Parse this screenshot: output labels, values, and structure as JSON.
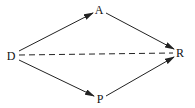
{
  "diagram": {
    "nodes": [
      {
        "id": "D",
        "label": "D",
        "x": 11,
        "y": 56
      },
      {
        "id": "A",
        "label": "A",
        "x": 99,
        "y": 10
      },
      {
        "id": "R",
        "label": "R",
        "x": 180,
        "y": 53
      },
      {
        "id": "P",
        "label": "P",
        "x": 100,
        "y": 99
      }
    ],
    "edges": [
      {
        "from": "D",
        "to": "A",
        "style": "solid",
        "arrow": true
      },
      {
        "from": "A",
        "to": "R",
        "style": "solid",
        "arrow": true
      },
      {
        "from": "D",
        "to": "P",
        "style": "solid",
        "arrow": true
      },
      {
        "from": "P",
        "to": "R",
        "style": "solid",
        "arrow": true
      },
      {
        "from": "D",
        "to": "R",
        "style": "dashed",
        "arrow": false
      }
    ],
    "colors": {
      "line": "#222222",
      "text": "#111111",
      "background": "#ffffff"
    }
  }
}
